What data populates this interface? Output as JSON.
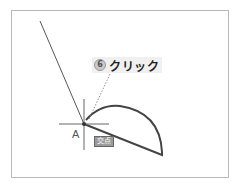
{
  "callout": {
    "step_number": "6",
    "action_label": "クリック"
  },
  "drawing": {
    "point_label": "A",
    "snap_tooltip": "交点",
    "colors": {
      "line": "#555555",
      "arc": "#444444",
      "cursor": "#666666",
      "leader": "#777777",
      "frame": "#b8b8b8"
    }
  }
}
